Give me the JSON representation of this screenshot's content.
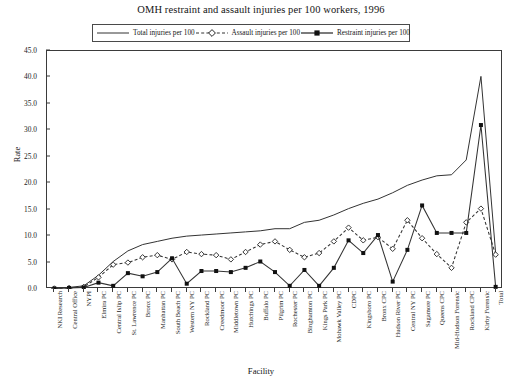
{
  "chart_data": {
    "type": "line",
    "title": "OMH restraint and assault injuries per 100 workers, 1996",
    "xlabel": "Facility",
    "ylabel": "Rate",
    "ylim": [
      0,
      45
    ],
    "ytick_step": 5,
    "ytick_labels": [
      "0.0",
      "5.0",
      "10.0",
      "15.0",
      "20.0",
      "25.0",
      "30.0",
      "35.0",
      "40.0",
      "45.0"
    ],
    "grid": false,
    "legend_position": "top-center",
    "categories": [
      "NKI Research",
      "Central Office",
      "NYPI",
      "Elmira PC",
      "Central Islip PC",
      "St. Lawrence PC",
      "Bronx PC",
      "Manhattan PC",
      "South Beach PC",
      "Western NY PC",
      "Rockland PC",
      "Creedmoor PC",
      "Middletown PC",
      "Hutchings PC",
      "Buffalo PC",
      "Pilgrim PC",
      "Rochester PC",
      "Binghamton PC",
      "Kings Park PC",
      "Mohawk Valley PC",
      "CDPC",
      "Kingsboro PC",
      "Bronx CPC",
      "Hudson River PC",
      "Central NY PC",
      "Sagamore PC",
      "Queens CPC",
      "Mid-Hudson Forensic",
      "Rockland CPC",
      "Kirby Forensic",
      "Total"
    ],
    "series": [
      {
        "name": "Total injuries per 100",
        "style": "solid",
        "marker": "none",
        "values": [
          0.2,
          0.3,
          0.6,
          2.6,
          5.2,
          7.2,
          8.4,
          9.0,
          9.6,
          10.0,
          10.2,
          10.4,
          10.6,
          10.8,
          11.0,
          11.4,
          11.4,
          12.6,
          13.0,
          14.0,
          15.2,
          16.2,
          17.0,
          18.2,
          19.6,
          20.6,
          21.4,
          21.6,
          24.4,
          40.2,
          6.8
        ]
      },
      {
        "name": "Assault injuries per 100",
        "style": "dashed",
        "marker": "diamond-open",
        "values": [
          0.1,
          0.2,
          0.4,
          2.2,
          4.6,
          5.0,
          6.0,
          6.4,
          5.6,
          7.0,
          6.6,
          6.4,
          5.6,
          7.0,
          8.4,
          9.0,
          7.4,
          6.0,
          6.8,
          9.0,
          11.6,
          9.2,
          9.8,
          7.6,
          13.0,
          9.6,
          6.6,
          4.0,
          12.6,
          15.2,
          6.5
        ]
      },
      {
        "name": "Restraint injuries per 100",
        "style": "solid",
        "marker": "square-filled",
        "values": [
          0.1,
          0.2,
          0.3,
          1.2,
          0.6,
          3.0,
          2.4,
          3.2,
          5.8,
          1.0,
          3.4,
          3.4,
          3.2,
          4.0,
          5.2,
          3.2,
          0.6,
          3.6,
          0.6,
          4.0,
          9.2,
          6.8,
          10.2,
          1.4,
          7.4,
          15.8,
          10.6,
          10.6,
          10.6,
          31.0,
          0.4
        ]
      }
    ]
  },
  "legend": {
    "items": [
      {
        "label": "Total injuries per 100",
        "icon": "solid-line-swatch"
      },
      {
        "label": "Assault injuries per 100",
        "icon": "dashed-diamond-swatch"
      },
      {
        "label": "Restraint injuries per 100",
        "icon": "solid-square-swatch"
      }
    ]
  },
  "colors": {
    "line": "#333333",
    "axis": "#3b3b3b",
    "text": "#141414",
    "background": "#ffffff"
  }
}
